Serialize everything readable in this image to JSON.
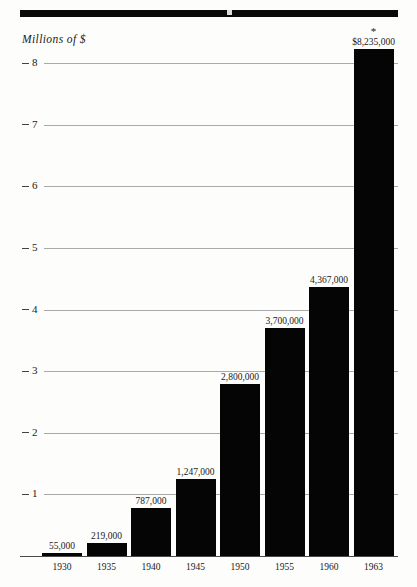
{
  "chart_data": {
    "type": "bar",
    "title": "",
    "subtitle": "",
    "xlabel": "",
    "ylabel": "Millions of $",
    "categories": [
      "1930",
      "1935",
      "1940",
      "1945",
      "1950",
      "1955",
      "1960",
      "1963"
    ],
    "values": [
      55000,
      219000,
      787000,
      1247000,
      2800000,
      3700000,
      4367000,
      8235000
    ],
    "value_labels": [
      "55,000",
      "219,000",
      "787,000",
      "1,247,000",
      "2,800,000",
      "3,700,000",
      "4,367,000",
      "$8,235,000"
    ],
    "annotations": [
      {
        "category": "1963",
        "marker": "*",
        "note": "asterisk above final bar label"
      }
    ],
    "y_ticks": [
      1,
      2,
      3,
      4,
      5,
      6,
      7,
      8
    ],
    "y_tick_labels": [
      "1",
      "2",
      "3",
      "4",
      "5",
      "6",
      "7",
      "8"
    ],
    "ylim": [
      0,
      8.5
    ],
    "y_units": "millions",
    "grid": true,
    "legend": null,
    "bar_color": "#050505",
    "grid_color": "#a9a9a9",
    "background_color": "#fdfdfc"
  },
  "axis": {
    "caption": "Millions of $"
  },
  "marks": {
    "asterisk": "*"
  }
}
